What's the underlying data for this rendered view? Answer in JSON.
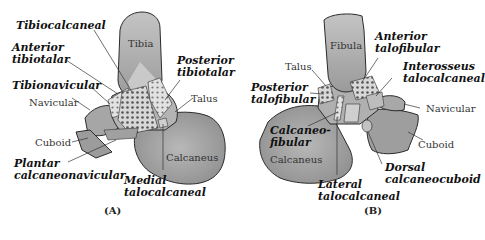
{
  "panels": [
    {
      "caption": "(A)",
      "bones": {
        "tibia": "Tibia",
        "talus": "Talus",
        "navicular": "Navicular",
        "cuboid": "Cuboid",
        "calcaneus": "Calcaneus"
      },
      "ligaments": {
        "tibiocalcaneal": "Tibiocalcaneal",
        "anterior_tibiotalar_1": "Anterior",
        "anterior_tibiotalar_2": "tibiotalar",
        "tibionavicular": "Tibionavicular",
        "posterior_tibiotalar_1": "Posterior",
        "posterior_tibiotalar_2": "tibiotalar",
        "plantar_calcaneonavicular_1": "Plantar",
        "plantar_calcaneonavicular_2": "calcaneonavicular",
        "medial_talocalcaneal_1": "Medial",
        "medial_talocalcaneal_2": "talocalcaneal"
      }
    },
    {
      "caption": "(B)",
      "bones": {
        "fibula": "Fibula",
        "talus": "Talus",
        "navicular": "Navicular",
        "cuboid": "Cuboid",
        "calcaneus": "Calcaneus"
      },
      "ligaments": {
        "anterior_talofibular_1": "Anterior",
        "anterior_talofibular_2": "talofibular",
        "interosseus_talocalcaneal_1": "Interosseus",
        "interosseus_talocalcaneal_2": "talocalcaneal",
        "posterior_talofibular_1": "Posterior",
        "posterior_talofibular_2": "talofibular",
        "calcaneofibular_1": "Calcaneo-",
        "calcaneofibular_2": "fibular",
        "lateral_talocalcaneal_1": "Lateral",
        "lateral_talocalcaneal_2": "talocalcaneal",
        "dorsal_calcaneocuboid_1": "Dorsal",
        "dorsal_calcaneocuboid_2": "calcaneocuboid"
      }
    }
  ],
  "colors": {
    "bone_light": "#bdbdbd",
    "bone_mid": "#9e9e9e",
    "bone_dark": "#8a8a8a",
    "outline": "#2b2b2b",
    "ligament_fill": "#d6d6d6",
    "dot": "#555555"
  }
}
